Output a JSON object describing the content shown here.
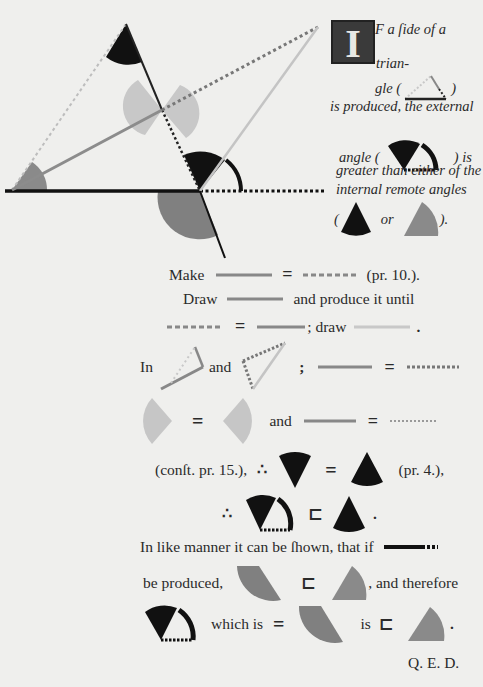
{
  "colors": {
    "background": "#efefed",
    "black": "#111111",
    "dark_gray": "#7a7a7a",
    "mid_gray": "#8c8c8c",
    "light_gray": "#c4c4c4",
    "text": "#2a2a2a"
  },
  "intro": {
    "initial": "I",
    "line1": "F a ſide of a",
    "line2": "trian-",
    "line3_prefix": "gle (",
    "line3_suffix": ")",
    "line4": "is produced, the external",
    "line5_prefix": "angle (",
    "line5_suffix": ") is",
    "line6": "greater than either of the",
    "line7": "internal remote angles",
    "line8_open": "(",
    "line8_or": "or",
    "line8_close": ")."
  },
  "proof": {
    "make": "Make",
    "pr10": "(pr. 10.).",
    "draw": "Draw",
    "produce_until": "and produce it until",
    "semicolon_draw": "; draw",
    "period": ".",
    "in": "In",
    "and": "and",
    "semicolon": ";",
    "and2": "and",
    "const15": "(conſt. pr. 15.),",
    "therefore": "∴",
    "pr4": "(pr. 4.),",
    "therefore2": "∴",
    "period2": ".",
    "like_manner": "In like manner it can be ſhown, that if",
    "be_produced": "be produced,",
    "and_therefore": ", and therefore",
    "which_is": "which is",
    "is": "is",
    "period3": ".",
    "qed": "Q. E. D."
  },
  "symbols": {
    "equals": "=",
    "greater": "⊏"
  }
}
